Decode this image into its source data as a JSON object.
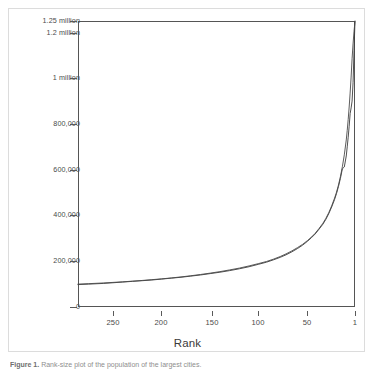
{
  "figure": {
    "caption_prefix": "Figure 1.",
    "caption_text": "Rank-size plot of the population of the largest cities."
  },
  "chart_data": {
    "type": "line",
    "title": "",
    "xlabel": "Rank",
    "ylabel": "",
    "xlim": [
      286,
      1
    ],
    "ylim": [
      0,
      1250000
    ],
    "x_reversed": true,
    "grid": false,
    "legend": "none",
    "xticks": [
      250,
      200,
      150,
      100,
      50,
      1
    ],
    "xtick_labels": [
      "250",
      "200",
      "150",
      "100",
      "50",
      "1"
    ],
    "yticks": [
      0,
      200000,
      400000,
      600000,
      800000,
      1000000,
      1200000,
      1250000
    ],
    "ytick_labels": [
      "0",
      "200,000",
      "400,000",
      "600,000",
      "800,000",
      "1 million",
      "1.2 million",
      "1.25 million"
    ],
    "series": [
      {
        "name": "Observed data",
        "style": "jagged",
        "color": "#3c3c3c",
        "x": [
          286,
          275,
          260,
          250,
          240,
          230,
          220,
          210,
          200,
          190,
          180,
          170,
          160,
          150,
          140,
          130,
          120,
          110,
          100,
          92,
          85,
          78,
          72,
          66,
          60,
          55,
          50,
          46,
          42,
          38,
          34,
          31,
          28,
          25,
          22,
          20,
          18,
          16,
          14,
          12,
          10,
          9,
          8,
          7,
          6,
          5,
          4,
          3,
          2,
          1
        ],
        "values": [
          98000,
          100000,
          103000,
          106000,
          109000,
          112000,
          115000,
          118000,
          122000,
          126000,
          130000,
          135000,
          140000,
          146000,
          152000,
          159000,
          167000,
          176000,
          187000,
          196000,
          206000,
          217000,
          228000,
          241000,
          256000,
          270000,
          287000,
          302000,
          319000,
          340000,
          362000,
          383000,
          408000,
          437000,
          470000,
          496000,
          527000,
          562000,
          604000,
          612000,
          660000,
          700000,
          742000,
          790000,
          845000,
          870000,
          900000,
          980000,
          1120000,
          1250000
        ]
      },
      {
        "name": "Fitted power law",
        "style": "smooth",
        "color": "#4a4a4a",
        "x": [
          286,
          275,
          260,
          250,
          240,
          230,
          220,
          210,
          200,
          190,
          180,
          170,
          160,
          150,
          140,
          130,
          120,
          110,
          100,
          92,
          85,
          78,
          72,
          66,
          60,
          55,
          50,
          46,
          42,
          38,
          34,
          31,
          28,
          25,
          22,
          20,
          18,
          16,
          14,
          12,
          10,
          9,
          8,
          7,
          6,
          5,
          4,
          3,
          2,
          1
        ],
        "values": [
          100000,
          102000,
          105000,
          107500,
          110000,
          113000,
          116000,
          119500,
          123000,
          127000,
          131500,
          136500,
          142000,
          148000,
          154500,
          162000,
          170000,
          179500,
          190000,
          199000,
          209000,
          220500,
          232000,
          245000,
          260000,
          273500,
          290000,
          305000,
          322000,
          343000,
          366000,
          387000,
          412000,
          442000,
          476000,
          502000,
          533000,
          570000,
          613000,
          665000,
          730000,
          772000,
          820000,
          874000,
          935000,
          1005000,
          1085000,
          1150000,
          1205000,
          1248000
        ]
      }
    ]
  }
}
